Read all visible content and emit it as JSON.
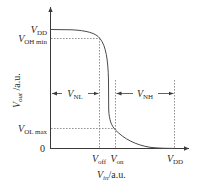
{
  "diagram": {
    "colors": {
      "axis": "#3a3a3a",
      "curve": "#4a4a4a",
      "dashed": "#7a7a7a",
      "text": "#2a2a2a"
    },
    "y_axis": {
      "label_main": "V",
      "label_sub": "out",
      "label_unit": " /a.u.",
      "ticks": [
        {
          "main": "V",
          "sub": "DD",
          "y": 29
        },
        {
          "main": "V",
          "sub": "OH min",
          "y": 38
        },
        {
          "main": "V",
          "sub": "OL max",
          "y": 128
        },
        {
          "main": "0",
          "sub": "",
          "y": 148
        }
      ]
    },
    "x_axis": {
      "label_main": "V",
      "label_sub": "in",
      "label_unit": "/a.u.",
      "ticks": [
        {
          "main": "V",
          "sub": "off",
          "x": 99
        },
        {
          "main": "V",
          "sub": "on",
          "x": 115
        },
        {
          "main": "V",
          "sub": "DD",
          "x": 174
        }
      ]
    },
    "annotations": [
      {
        "main": "V",
        "sub": "NL",
        "from_x": 51,
        "to_x": 99,
        "y": 93
      },
      {
        "main": "V",
        "sub": "NH",
        "from_x": 115,
        "to_x": 174,
        "y": 93
      }
    ]
  }
}
